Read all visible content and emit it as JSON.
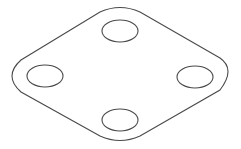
{
  "drawing": {
    "type": "isometric-plate",
    "description": "Rounded diamond plate with four elliptical holes",
    "line_color": "#4a4a4a",
    "background": "#ffffff",
    "holes": [
      {
        "name": "top",
        "cx": 120,
        "cy": 31,
        "rx": 18,
        "ry": 11
      },
      {
        "name": "left",
        "cx": 45,
        "cy": 76,
        "rx": 18,
        "ry": 11
      },
      {
        "name": "right",
        "cx": 195,
        "cy": 77,
        "rx": 18,
        "ry": 11
      },
      {
        "name": "bottom",
        "cx": 120,
        "cy": 120,
        "rx": 18,
        "ry": 11
      }
    ]
  }
}
